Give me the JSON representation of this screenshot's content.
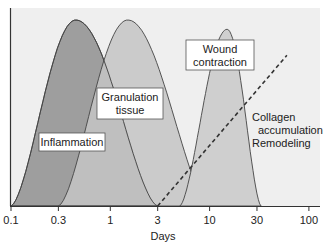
{
  "chart_data": {
    "type": "area",
    "title": "",
    "xlabel": "Days",
    "ylabel": "",
    "xscale": "log",
    "xlim": [
      0.1,
      130
    ],
    "ylim": [
      0,
      1
    ],
    "grid": false,
    "x_ticks": [
      0.1,
      0.3,
      1,
      3,
      10,
      30,
      100
    ],
    "x_tick_labels": [
      "0.1",
      "0.3",
      "1",
      "3",
      "10",
      "30",
      "100"
    ],
    "series": [
      {
        "name": "Inflammation",
        "label_lines": [
          "Inflammation"
        ],
        "style": "filled-curve",
        "color": "#9e9e9e",
        "start": 0.1,
        "peak_x": 0.45,
        "peak_y": 1.0,
        "end": 3
      },
      {
        "name": "Granulation tissue",
        "label_lines": [
          "Granulation",
          "tissue"
        ],
        "style": "filled-curve",
        "color": "#c4c4c4",
        "start": 0.3,
        "peak_x": 1.5,
        "peak_y": 1.0,
        "end": 10
      },
      {
        "name": "Wound contraction",
        "label_lines": [
          "Wound",
          "contraction"
        ],
        "style": "filled-curve",
        "color": "#cfcfcf",
        "start": 5,
        "peak_x": 15,
        "peak_y": 0.95,
        "end": 33
      },
      {
        "name": "Collagen accumulation Remodeling",
        "label_lines": [
          "Collagen",
          "accumulation",
          "Remodeling"
        ],
        "style": "dashed-line",
        "color": "#333333",
        "points": [
          [
            3,
            0
          ],
          [
            60,
            0.81
          ]
        ]
      }
    ],
    "background_color": "#efefef",
    "axis_color": "#333333"
  }
}
